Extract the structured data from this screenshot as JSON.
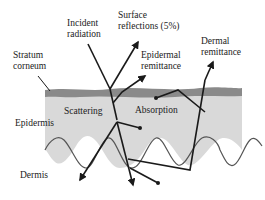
{
  "diagram": {
    "labels": {
      "incident_line1": "Incident",
      "incident_line2": "radiation",
      "surface_line1": "Surface",
      "surface_line2": "reflections (5%)",
      "stratum_line1": "Stratum",
      "stratum_line2": "corneum",
      "epidermal_line1": "Epidermal",
      "epidermal_line2": "remittance",
      "dermal_line1": "Dermal",
      "dermal_line2": "remittance",
      "epidermis": "Epidermis",
      "scattering": "Scattering",
      "absorption": "Absorption",
      "dermis": "Dermis"
    },
    "colors": {
      "stratum_corneum": "#8a8a8a",
      "epidermis_fill": "#d9d9d9",
      "lines": "#1a1a1a",
      "background": "#ffffff"
    }
  }
}
